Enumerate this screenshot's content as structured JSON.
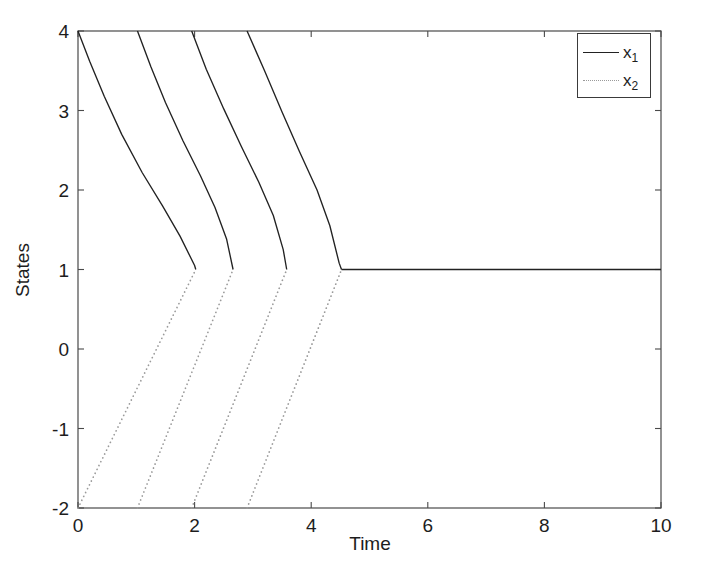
{
  "chart_data": {
    "type": "line",
    "title": "",
    "xlabel": "Time",
    "ylabel": "States",
    "xlim": [
      0,
      10
    ],
    "ylim": [
      -2,
      4
    ],
    "xticks": [
      0,
      2,
      4,
      6,
      8,
      10
    ],
    "yticks": [
      -2,
      -1,
      0,
      1,
      2,
      3,
      4
    ],
    "xtick_labels": [
      "0",
      "2",
      "4",
      "6",
      "8",
      "10"
    ],
    "ytick_labels": [
      "-2",
      "-1",
      "0",
      "1",
      "2",
      "3",
      "4"
    ],
    "grid": false,
    "legend_position": "upper right",
    "legend": [
      {
        "label": "x",
        "sub": "1",
        "style": "solid",
        "color": "#222222"
      },
      {
        "label": "x",
        "sub": "2",
        "style": "dotted",
        "color": "#9a9a9a"
      }
    ],
    "series": [
      {
        "name": "x1",
        "style": "solid",
        "color": "#222222",
        "description": "State x1 resets to 4 at each switching instant and decays to 1",
        "segments": [
          {
            "points": [
              [
                0.0,
                4.0
              ],
              [
                0.2,
                3.62
              ],
              [
                0.45,
                3.18
              ],
              [
                0.75,
                2.7
              ],
              [
                1.1,
                2.22
              ],
              [
                1.45,
                1.8
              ],
              [
                1.75,
                1.42
              ],
              [
                2.0,
                1.05
              ],
              [
                2.02,
                1.0
              ]
            ]
          },
          {
            "points": [
              [
                1.02,
                4.0
              ],
              [
                1.25,
                3.55
              ],
              [
                1.5,
                3.1
              ],
              [
                1.8,
                2.62
              ],
              [
                2.1,
                2.18
              ],
              [
                2.35,
                1.78
              ],
              [
                2.55,
                1.38
              ],
              [
                2.66,
                1.0
              ]
            ]
          },
          {
            "points": [
              [
                1.95,
                4.0
              ],
              [
                2.2,
                3.52
              ],
              [
                2.5,
                3.02
              ],
              [
                2.8,
                2.55
              ],
              [
                3.1,
                2.1
              ],
              [
                3.35,
                1.68
              ],
              [
                3.52,
                1.25
              ],
              [
                3.58,
                1.0
              ]
            ]
          },
          {
            "points": [
              [
                2.9,
                4.0
              ],
              [
                3.2,
                3.5
              ],
              [
                3.5,
                2.98
              ],
              [
                3.8,
                2.48
              ],
              [
                4.1,
                2.0
              ],
              [
                4.32,
                1.55
              ],
              [
                4.48,
                1.08
              ],
              [
                4.52,
                1.0
              ]
            ]
          },
          {
            "points": [
              [
                4.52,
                1.0
              ],
              [
                10.0,
                1.0
              ]
            ]
          }
        ]
      },
      {
        "name": "x2",
        "style": "dotted",
        "color": "#9a9a9a",
        "description": "State x2 resets to -2 at each switching instant and rises to 1",
        "segments": [
          {
            "points": [
              [
                0.0,
                -2.0
              ],
              [
                2.02,
                1.0
              ]
            ]
          },
          {
            "points": [
              [
                1.02,
                -2.0
              ],
              [
                2.66,
                1.0
              ]
            ]
          },
          {
            "points": [
              [
                1.95,
                -2.0
              ],
              [
                3.58,
                1.0
              ]
            ]
          },
          {
            "points": [
              [
                2.9,
                -2.0
              ],
              [
                4.52,
                1.0
              ]
            ]
          }
        ]
      }
    ],
    "switching_times": [
      0.0,
      1.02,
      1.95,
      2.9
    ],
    "settling_values": {
      "x1": 1.0,
      "x2": 1.0
    },
    "reset_values": {
      "x1": 4.0,
      "x2": -2.0
    }
  },
  "axes": {
    "box_left_px": 78,
    "box_right_px": 661,
    "box_top_px": 31,
    "box_bottom_px": 508
  }
}
